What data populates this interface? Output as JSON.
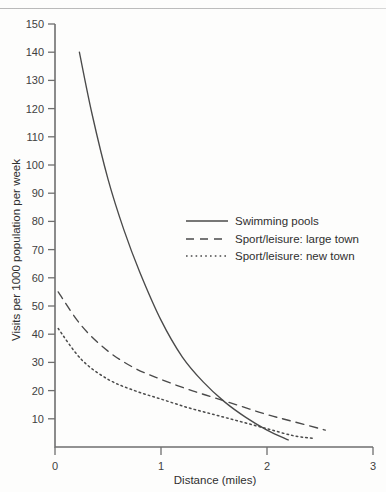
{
  "figure": {
    "background_color": "#fdfdfc",
    "ink_color": "#4a4a4a",
    "axis_color": "#6f6f6f"
  },
  "chart_data": {
    "type": "line",
    "title": "",
    "xlabel": "Distance (miles)",
    "ylabel": "Visits per 1000 population per week",
    "xlim": [
      0,
      3
    ],
    "ylim": [
      0,
      150
    ],
    "xticks": [
      0,
      1,
      2,
      3
    ],
    "xtick_labels": [
      "0",
      "1",
      "2",
      "3"
    ],
    "yticks": [
      10,
      20,
      30,
      40,
      50,
      60,
      70,
      80,
      90,
      100,
      110,
      120,
      130,
      140,
      150
    ],
    "ytick_labels": [
      "10",
      "20",
      "30",
      "40",
      "50",
      "60",
      "70",
      "80",
      "90",
      "100",
      "110",
      "120",
      "130",
      "140",
      "150"
    ],
    "grid": false,
    "legend_position": "center-right",
    "series": [
      {
        "name": "Swimming pools",
        "style": "solid",
        "x": [
          0.23,
          0.35,
          0.5,
          0.65,
          0.8,
          1.0,
          1.2,
          1.4,
          1.6,
          1.8,
          2.0,
          2.2
        ],
        "y": [
          140,
          118,
          95,
          77,
          62,
          45,
          32,
          23,
          16,
          10.5,
          6,
          2.5
        ]
      },
      {
        "name": "Sport/leisure: large town",
        "style": "dashed",
        "x": [
          0.03,
          0.25,
          0.5,
          0.75,
          1.0,
          1.25,
          1.5,
          1.75,
          2.0,
          2.25,
          2.55
        ],
        "y": [
          55,
          43,
          34,
          28,
          24,
          20.5,
          17.5,
          14.5,
          11.5,
          9,
          6
        ]
      },
      {
        "name": "Sport/leisure: new town",
        "style": "dotted",
        "x": [
          0.03,
          0.25,
          0.5,
          0.75,
          1.0,
          1.25,
          1.5,
          1.75,
          2.0,
          2.25,
          2.45
        ],
        "y": [
          42,
          31,
          24,
          20,
          17,
          14,
          11.5,
          9,
          6.5,
          4,
          3
        ]
      }
    ]
  }
}
